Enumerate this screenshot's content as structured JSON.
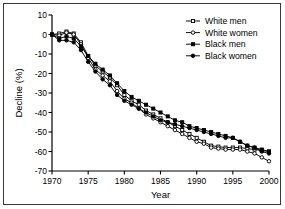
{
  "figure": {
    "background": "#ffffff",
    "frame_color": "#3a3a3a",
    "axis_color": "#000000"
  },
  "chart_data": {
    "type": "line",
    "title": "",
    "xlabel": "Year",
    "ylabel": "Decline (%)",
    "xlim": [
      1970,
      2000
    ],
    "ylim": [
      -70,
      10
    ],
    "xticks": [
      1970,
      1975,
      1980,
      1985,
      1990,
      1995,
      2000
    ],
    "xticklabels": [
      "1970",
      "1975",
      "1980",
      "1985",
      "1990",
      "1995",
      "2000"
    ],
    "yticks": [
      10,
      0,
      -10,
      -20,
      -30,
      -40,
      -50,
      -60,
      -70
    ],
    "yticklabels": [
      "10",
      "0",
      "-10",
      "-20",
      "-30",
      "-40",
      "-50",
      "-60",
      "-70"
    ],
    "grid": false,
    "legend_position": "top-right",
    "x": [
      1970,
      1971,
      1972,
      1973,
      1974,
      1975,
      1976,
      1977,
      1978,
      1979,
      1980,
      1981,
      1982,
      1983,
      1984,
      1985,
      1986,
      1987,
      1988,
      1989,
      1990,
      1991,
      1992,
      1993,
      1994,
      1995,
      1996,
      1997,
      1998,
      1999,
      2000
    ],
    "series": [
      {
        "name": "White men",
        "marker": "open-square",
        "color": "#000000",
        "fill": "#ffffff",
        "values": [
          0,
          0.5,
          1.5,
          0.5,
          -4,
          -11,
          -16,
          -19,
          -22,
          -26,
          -31,
          -34,
          -36,
          -39,
          -41,
          -43,
          -45,
          -47,
          -49,
          -51,
          -53,
          -55,
          -57,
          -57.5,
          -58,
          -58,
          -58,
          -58.5,
          -59,
          -59.5,
          -60
        ]
      },
      {
        "name": "White women",
        "marker": "open-circle",
        "color": "#000000",
        "fill": "#ffffff",
        "values": [
          0,
          -0.5,
          1,
          0,
          -5,
          -12,
          -18,
          -21,
          -24,
          -29,
          -33,
          -35,
          -38,
          -41,
          -43,
          -45,
          -47,
          -49,
          -51,
          -53,
          -55,
          -56,
          -58,
          -58.5,
          -59,
          -59,
          -59,
          -60,
          -61,
          -63,
          -65
        ]
      },
      {
        "name": "Black men",
        "marker": "filled-square",
        "color": "#000000",
        "fill": "#000000",
        "values": [
          0,
          -2,
          -1,
          -2,
          -6,
          -11,
          -15,
          -18,
          -21,
          -25,
          -29,
          -32,
          -34,
          -36,
          -38,
          -40,
          -42,
          -44,
          -45,
          -47,
          -48,
          -49,
          -50,
          -51,
          -52,
          -53,
          -55,
          -57,
          -58,
          -59,
          -60
        ]
      },
      {
        "name": "Black women",
        "marker": "filled-circle",
        "color": "#000000",
        "fill": "#000000",
        "values": [
          0,
          -3,
          -3,
          -4,
          -8,
          -14,
          -19,
          -23,
          -26,
          -31,
          -34,
          -36,
          -38,
          -40,
          -42,
          -44,
          -45,
          -46,
          -47,
          -48,
          -49,
          -50,
          -51,
          -52,
          -53,
          -53,
          -55,
          -57,
          -58,
          -60,
          -61
        ]
      }
    ],
    "legend": [
      {
        "label": "White men",
        "marker": "open-square"
      },
      {
        "label": "White women",
        "marker": "open-circle"
      },
      {
        "label": "Black men",
        "marker": "filled-square"
      },
      {
        "label": "Black women",
        "marker": "filled-circle"
      }
    ]
  }
}
